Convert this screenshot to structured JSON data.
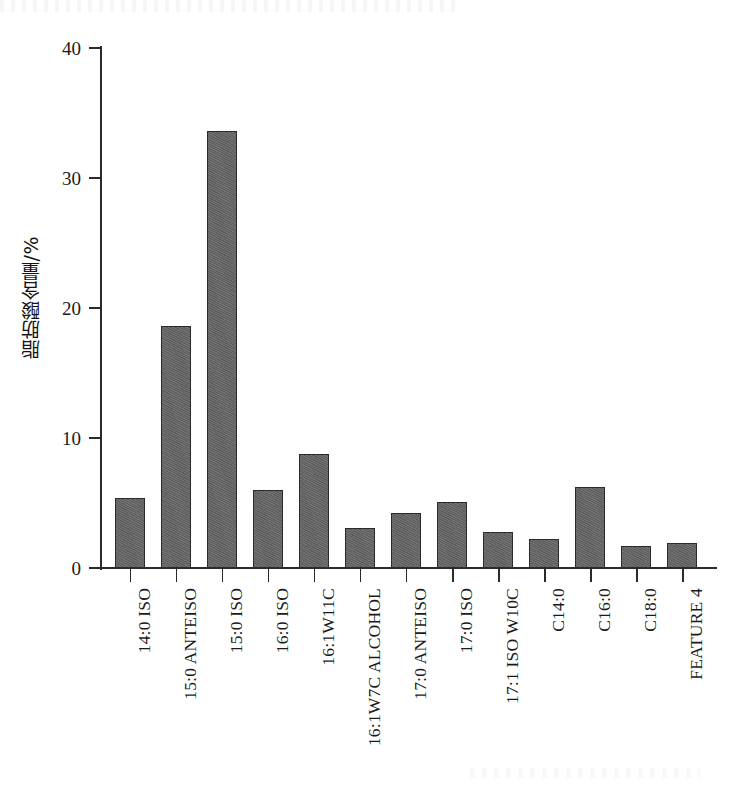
{
  "chart_data": {
    "type": "bar",
    "title": "",
    "xlabel": "",
    "ylabel": "脂肪酸含量/%",
    "ylim": [
      0,
      40
    ],
    "yticks": [
      0,
      10,
      20,
      30,
      40
    ],
    "grid": false,
    "legend": null,
    "bar_color": "#636363",
    "bar_edge_color": "#2b2b2b",
    "axis_color": "#2a2a2a",
    "categories": [
      "14:0 ISO",
      "15:0 ANTEISO",
      "15:0 ISO",
      "16:0 ISO",
      "16:1W11C",
      "16:1W7C ALCOHOL",
      "17:0 ANTEISO",
      "17:0 ISO",
      "17:1 ISO W10C",
      "C14:0",
      "C16:0",
      "C18:0",
      "FEATURE 4"
    ],
    "values": [
      5.4,
      18.6,
      33.6,
      6.0,
      8.8,
      3.1,
      4.2,
      5.1,
      2.8,
      2.2,
      6.2,
      1.7,
      1.9
    ]
  }
}
